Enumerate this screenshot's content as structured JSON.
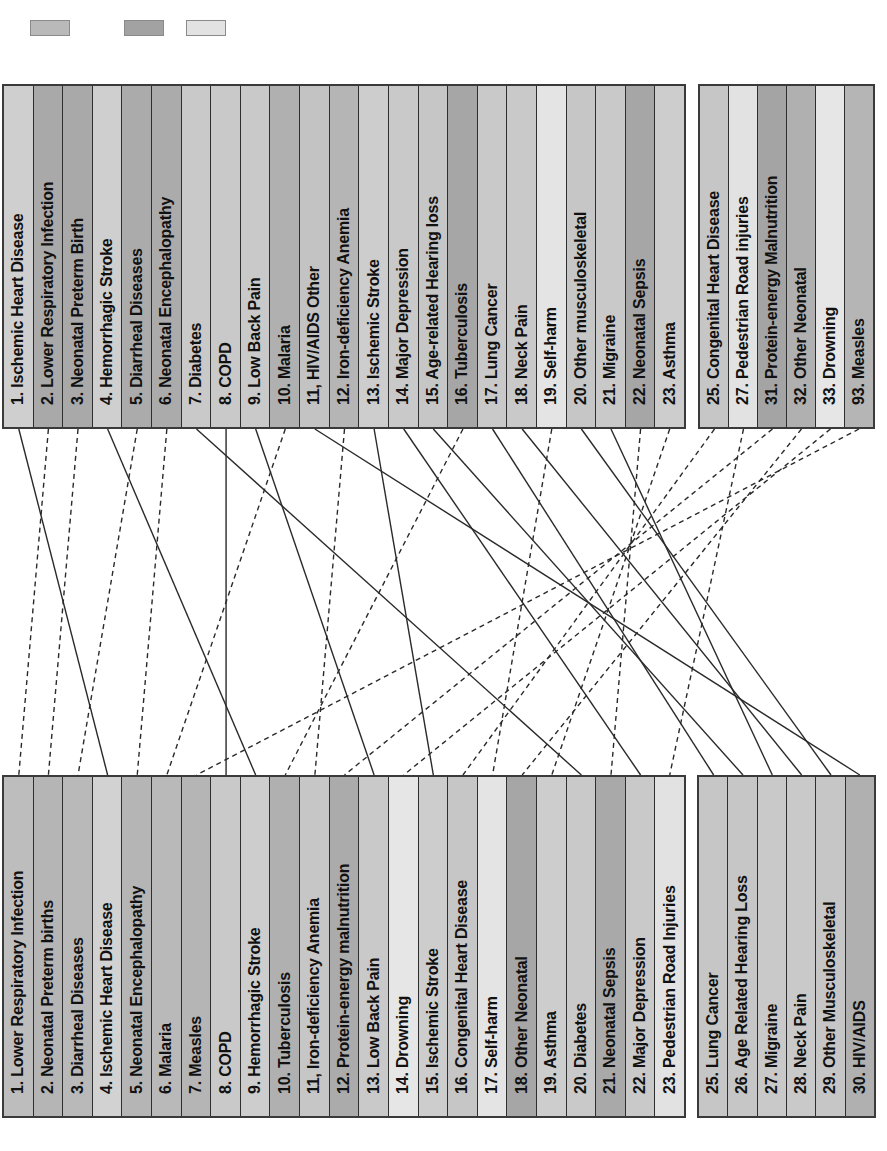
{
  "legend": {
    "swatches": [
      {
        "name": "legend-swatch-1",
        "color": "#b9b9b9",
        "x": 30
      },
      {
        "name": "legend-swatch-2",
        "color": "#a2a2a2",
        "x": 124
      },
      {
        "name": "legend-swatch-3",
        "color": "#e2e2e2",
        "x": 186
      }
    ]
  },
  "top": {
    "main": [
      {
        "rank": 1,
        "label": "1. Ischemic Heart Disease",
        "shade": "#cfcfcf"
      },
      {
        "rank": 2,
        "label": "2. Lower Respiratory Infection",
        "shade": "#a9a9a9"
      },
      {
        "rank": 3,
        "label": "3. Neonatal Preterm Birth",
        "shade": "#a9a9a9"
      },
      {
        "rank": 4,
        "label": "4. Hemorrhagic Stroke",
        "shade": "#cfcfcf"
      },
      {
        "rank": 5,
        "label": "5. Diarrheal Diseases",
        "shade": "#ababab"
      },
      {
        "rank": 6,
        "label": "6. Neonatal Encephalopathy",
        "shade": "#ababab"
      },
      {
        "rank": 7,
        "label": "7. Diabetes",
        "shade": "#c9c9c9"
      },
      {
        "rank": 8,
        "label": "8. COPD",
        "shade": "#c9c9c9"
      },
      {
        "rank": 9,
        "label": "9. Low Back Pain",
        "shade": "#c9c9c9"
      },
      {
        "rank": 10,
        "label": "10. Malaria",
        "shade": "#b0b0b0"
      },
      {
        "rank": 11,
        "label": "11, HIV/AIDS Other",
        "shade": "#c3c3c3"
      },
      {
        "rank": 12,
        "label": "12. Iron-deficiency Anemia",
        "shade": "#b5b5b5"
      },
      {
        "rank": 13,
        "label": "13. Ischemic Stroke",
        "shade": "#cdcdcd"
      },
      {
        "rank": 14,
        "label": "14. Major Depression",
        "shade": "#c9c9c9"
      },
      {
        "rank": 15,
        "label": "15. Age-related Hearing loss",
        "shade": "#c6c6c6"
      },
      {
        "rank": 16,
        "label": "16. Tuberculosis",
        "shade": "#a6a6a6"
      },
      {
        "rank": 17,
        "label": "17. Lung Cancer",
        "shade": "#c9c9c9"
      },
      {
        "rank": 18,
        "label": "18. Neck Pain",
        "shade": "#c9c9c9"
      },
      {
        "rank": 19,
        "label": "19. Self-harm",
        "shade": "#e4e4e4"
      },
      {
        "rank": 20,
        "label": "20. Other musculoskeletal",
        "shade": "#c6c6c6"
      },
      {
        "rank": 21,
        "label": "21. Migraine",
        "shade": "#c9c9c9"
      },
      {
        "rank": 22,
        "label": "22. Neonatal Sepsis",
        "shade": "#a6a6a6"
      },
      {
        "rank": 23,
        "label": "23. Asthma",
        "shade": "#cdcdcd"
      }
    ],
    "extra": [
      {
        "rank": 25,
        "label": "25. Congenital Heart Disease",
        "shade": "#c6c6c6"
      },
      {
        "rank": 27,
        "label": "27. Pedestrian Road injuries",
        "shade": "#e2e2e2"
      },
      {
        "rank": 31,
        "label": "31. Protein-energy Malnutrition",
        "shade": "#a4a4a4"
      },
      {
        "rank": 32,
        "label": "32. Other Neonatal",
        "shade": "#b0b0b0"
      },
      {
        "rank": 33,
        "label": "33. Drowning",
        "shade": "#e6e6e6"
      },
      {
        "rank": 93,
        "label": "93. Measles",
        "shade": "#b5b5b5"
      }
    ]
  },
  "bottom": {
    "main": [
      {
        "rank": 1,
        "label": "1. Lower Respiratory Infection",
        "shade": "#bdbdbd"
      },
      {
        "rank": 2,
        "label": "2. Neonatal Preterm births",
        "shade": "#b5b5b5"
      },
      {
        "rank": 3,
        "label": "3. Diarrheal Diseases",
        "shade": "#b9b9b9"
      },
      {
        "rank": 4,
        "label": "4. Ischemic Heart Disease",
        "shade": "#d2d2d2"
      },
      {
        "rank": 5,
        "label": "5. Neonatal Encephalopathy",
        "shade": "#b5b5b5"
      },
      {
        "rank": 6,
        "label": "6. Malaria",
        "shade": "#b9b9b9"
      },
      {
        "rank": 7,
        "label": "7. Measles",
        "shade": "#b5b5b5"
      },
      {
        "rank": 8,
        "label": "8. COPD",
        "shade": "#c9c9c9"
      },
      {
        "rank": 9,
        "label": "9. Hemorrhagic Stroke",
        "shade": "#cdcdcd"
      },
      {
        "rank": 10,
        "label": "10. Tuberculosis",
        "shade": "#b0b0b0"
      },
      {
        "rank": 11,
        "label": "11, Iron-deficiency Anemia",
        "shade": "#c6c6c6"
      },
      {
        "rank": 12,
        "label": "12. Protein-energy malnutrition",
        "shade": "#ababab"
      },
      {
        "rank": 13,
        "label": "13. Low Back Pain",
        "shade": "#c9c9c9"
      },
      {
        "rank": 14,
        "label": "14. Drowning",
        "shade": "#e6e6e6"
      },
      {
        "rank": 15,
        "label": "15. Ischemic Stroke",
        "shade": "#cdcdcd"
      },
      {
        "rank": 16,
        "label": "16. Congenital Heart Disease",
        "shade": "#c6c6c6"
      },
      {
        "rank": 17,
        "label": "17. Self-harm",
        "shade": "#e4e4e4"
      },
      {
        "rank": 18,
        "label": "18. Other Neonatal",
        "shade": "#a6a6a6"
      },
      {
        "rank": 19,
        "label": "19. Asthma",
        "shade": "#cdcdcd"
      },
      {
        "rank": 20,
        "label": "20. Diabetes",
        "shade": "#c9c9c9"
      },
      {
        "rank": 21,
        "label": "21. Neonatal Sepsis",
        "shade": "#a9a9a9"
      },
      {
        "rank": 22,
        "label": "22. Major Depression",
        "shade": "#c9c9c9"
      },
      {
        "rank": 23,
        "label": "23. Pedestrian Road Injuries",
        "shade": "#e2e2e2"
      }
    ],
    "extra": [
      {
        "rank": 25,
        "label": "25. Lung Cancer",
        "shade": "#c6c6c6"
      },
      {
        "rank": 26,
        "label": "26. Age Related Hearing Loss",
        "shade": "#c6c6c6"
      },
      {
        "rank": 27,
        "label": "27. Migraine",
        "shade": "#c9c9c9"
      },
      {
        "rank": 28,
        "label": "28. Neck Pain",
        "shade": "#c9c9c9"
      },
      {
        "rank": 29,
        "label": "29. Other Musculoskeletal",
        "shade": "#c6c6c6"
      },
      {
        "rank": 30,
        "label": "30. HIV/AIDS",
        "shade": "#b0b0b0"
      }
    ]
  },
  "connections": [
    {
      "top": 1,
      "bottom": 4,
      "style": "solid"
    },
    {
      "top": 2,
      "bottom": 1,
      "style": "dashed"
    },
    {
      "top": 3,
      "bottom": 2,
      "style": "dashed"
    },
    {
      "top": 4,
      "bottom": 9,
      "style": "solid"
    },
    {
      "top": 5,
      "bottom": 3,
      "style": "dashed"
    },
    {
      "top": 6,
      "bottom": 5,
      "style": "dashed"
    },
    {
      "top": 7,
      "bottom": 20,
      "style": "solid"
    },
    {
      "top": 8,
      "bottom": 8,
      "style": "solid"
    },
    {
      "top": 9,
      "bottom": 13,
      "style": "solid"
    },
    {
      "top": 10,
      "bottom": 6,
      "style": "dashed"
    },
    {
      "top": 11,
      "bottom": 30,
      "style": "solid"
    },
    {
      "top": 12,
      "bottom": 11,
      "style": "dashed"
    },
    {
      "top": 13,
      "bottom": 15,
      "style": "solid"
    },
    {
      "top": 14,
      "bottom": 22,
      "style": "solid"
    },
    {
      "top": 15,
      "bottom": 26,
      "style": "solid"
    },
    {
      "top": 16,
      "bottom": 10,
      "style": "dashed"
    },
    {
      "top": 17,
      "bottom": 25,
      "style": "solid"
    },
    {
      "top": 18,
      "bottom": 28,
      "style": "solid"
    },
    {
      "top": 19,
      "bottom": 17,
      "style": "dashed"
    },
    {
      "top": 20,
      "bottom": 29,
      "style": "solid"
    },
    {
      "top": 21,
      "bottom": 27,
      "style": "solid"
    },
    {
      "top": 22,
      "bottom": 21,
      "style": "dashed"
    },
    {
      "top": 23,
      "bottom": 19,
      "style": "dashed"
    },
    {
      "top": 25,
      "bottom": 16,
      "style": "dashed"
    },
    {
      "top": 27,
      "bottom": 23,
      "style": "dashed"
    },
    {
      "top": 31,
      "bottom": 12,
      "style": "dashed"
    },
    {
      "top": 32,
      "bottom": 18,
      "style": "dashed"
    },
    {
      "top": 33,
      "bottom": 14,
      "style": "dashed"
    },
    {
      "top": 93,
      "bottom": 7,
      "style": "dashed"
    }
  ]
}
